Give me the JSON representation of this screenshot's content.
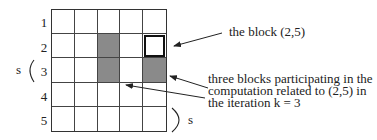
{
  "diagram": {
    "grid": {
      "rows": 5,
      "cols": 5,
      "row_labels": [
        "1",
        "2",
        "3",
        "4",
        "5"
      ],
      "shaded_cells": [
        [
          2,
          3
        ],
        [
          3,
          3
        ],
        [
          3,
          5
        ]
      ],
      "highlighted_cell": [
        2,
        5
      ]
    },
    "bracket_left_label": "s",
    "bracket_right_label": "s",
    "annotation_block": "the block (2,5)",
    "annotation_three": {
      "line1": "three blocks participating in the",
      "line2": "computation related to (2,5) in",
      "line3": "the iteration k = 3"
    }
  }
}
